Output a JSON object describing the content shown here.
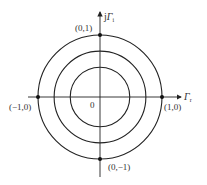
{
  "diagram": {
    "type": "reflection-coefficient-plane",
    "axes": {
      "real_label": "Γ",
      "real_subscript": "r",
      "imag_label_prefix": "j",
      "imag_label": "Γ",
      "imag_subscript": "i"
    },
    "origin_label": "0",
    "circles": [
      {
        "name": "unit-circle",
        "radius": 1.0
      },
      {
        "name": "middle-circle",
        "radius": 0.74
      },
      {
        "name": "inner-circle",
        "radius": 0.48
      }
    ],
    "points": [
      {
        "name": "point-0-1",
        "label": "(0,1)",
        "x": 0,
        "y": 1
      },
      {
        "name": "point-1-0",
        "label": "(1,0)",
        "x": 1,
        "y": 0
      },
      {
        "name": "point-neg1-0",
        "label": "(−1,0)",
        "x": -1,
        "y": 0
      },
      {
        "name": "point-0-neg1",
        "label": "(0,−1)",
        "x": 0,
        "y": -1
      }
    ],
    "colors": {
      "stroke": "#222222",
      "text": "#333333",
      "background": "#ffffff"
    }
  }
}
